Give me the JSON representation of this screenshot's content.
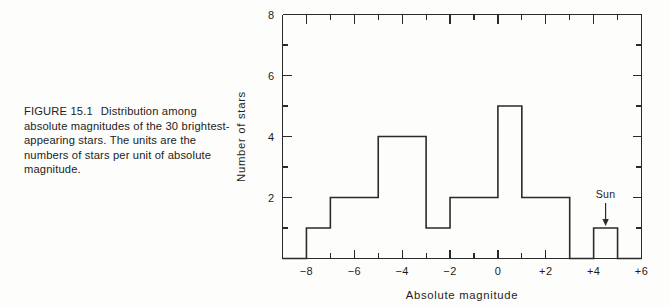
{
  "caption": {
    "figure_number": "FIGURE 15.1",
    "text": "Distribution among absolute magnitudes of the 30 brightest-appearing stars. The units are the numbers of stars per unit of absolute magnitude."
  },
  "chart_data": {
    "type": "bar",
    "title": "",
    "xlabel": "Absolute magnitude",
    "ylabel": "Number of stars",
    "xlim": [
      -9,
      6
    ],
    "ylim": [
      0,
      8
    ],
    "grid": false,
    "legend": null,
    "bin_width": 1,
    "bin_edges": [
      -9,
      -8,
      -7,
      -6,
      -5,
      -4,
      -3,
      -2,
      -1,
      0,
      1,
      2,
      3,
      4,
      5,
      6
    ],
    "values": [
      0,
      1,
      2,
      2,
      4,
      4,
      1,
      2,
      2,
      5,
      2,
      2,
      0,
      1,
      0
    ],
    "bins": [
      {
        "from": -9,
        "to": -8,
        "count": 0
      },
      {
        "from": -8,
        "to": -7,
        "count": 1
      },
      {
        "from": -7,
        "to": -6,
        "count": 2
      },
      {
        "from": -6,
        "to": -5,
        "count": 2
      },
      {
        "from": -5,
        "to": -4,
        "count": 4
      },
      {
        "from": -4,
        "to": -3,
        "count": 4
      },
      {
        "from": -3,
        "to": -2,
        "count": 1
      },
      {
        "from": -2,
        "to": -1,
        "count": 2
      },
      {
        "from": -1,
        "to": 0,
        "count": 2
      },
      {
        "from": 0,
        "to": 1,
        "count": 5
      },
      {
        "from": 1,
        "to": 2,
        "count": 2
      },
      {
        "from": 2,
        "to": 3,
        "count": 2
      },
      {
        "from": 3,
        "to": 4,
        "count": 0
      },
      {
        "from": 4,
        "to": 5,
        "count": 1
      },
      {
        "from": 5,
        "to": 6,
        "count": 0
      }
    ],
    "x_ticks_major": [
      -8,
      -6,
      -4,
      -2,
      0,
      2,
      4,
      6
    ],
    "x_tick_labels": [
      "−8",
      "−6",
      "−4",
      "−2",
      "0",
      "+2",
      "+4",
      "+6"
    ],
    "x_ticks_minor": [
      -9,
      -7,
      -5,
      -3,
      -1,
      1,
      3,
      5
    ],
    "y_ticks_major": [
      2,
      4,
      6,
      8
    ],
    "y_tick_labels": [
      "2",
      "4",
      "6",
      "8"
    ],
    "y_ticks_minor": [
      1,
      3,
      5,
      7
    ],
    "annotations": [
      {
        "label": "Sun",
        "x": 4.5,
        "y": 1,
        "marker": "down-arrow"
      }
    ]
  },
  "colors": {
    "background": "#fdfdfb",
    "ink": "#2b2b2b",
    "text": "#1d1d1d"
  }
}
